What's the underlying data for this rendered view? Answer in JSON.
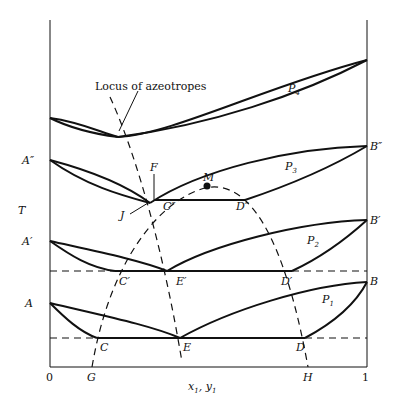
{
  "diagram": {
    "axes": {
      "y_label": "T",
      "x_label_main": "x",
      "x_label_sub1": "1",
      "x_label_sep": ", ",
      "x_label_main2": "y",
      "x_label_sub2": "1",
      "x_ticks": [
        "0",
        "1"
      ],
      "x_points": [
        "G",
        "H"
      ]
    },
    "annotation": "Locus of azeotropes",
    "left_points": [
      "A″",
      "A′",
      "A"
    ],
    "right_points": [
      "B″",
      "B′",
      "B"
    ],
    "panels": [
      {
        "name": "P",
        "sub": "4"
      },
      {
        "name": "P",
        "sub": "3"
      },
      {
        "name": "P",
        "sub": "2"
      },
      {
        "name": "P",
        "sub": "1"
      }
    ],
    "points": {
      "F": "F",
      "J": "J",
      "M": "M",
      "C2": "C″",
      "D2": "D″",
      "C1": "C′",
      "E1": "E′",
      "D1": "D′",
      "C": "C",
      "E": "E",
      "D": "D"
    }
  }
}
